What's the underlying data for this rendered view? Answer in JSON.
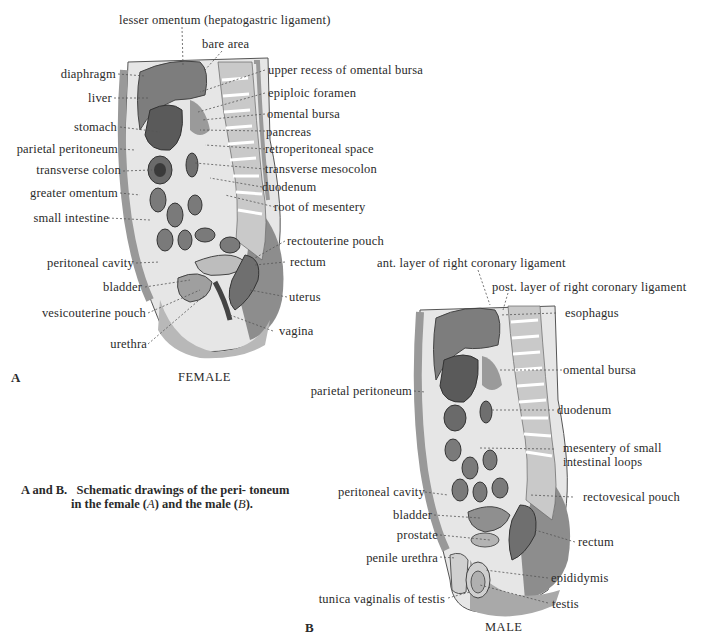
{
  "figure_a": {
    "letter": "A",
    "sex_label": "FEMALE",
    "labels": {
      "lesser_omentum": "lesser omentum (hepatogastric ligament)",
      "bare_area": "bare area",
      "diaphragm": "diaphragm",
      "liver": "liver",
      "stomach": "stomach",
      "parietal_peritoneum": "parietal peritoneum",
      "transverse_colon": "transverse colon",
      "greater_omentum": "greater omentum",
      "small_intestine": "small intestine",
      "peritoneal_cavity": "peritoneal cavity",
      "bladder": "bladder",
      "vesicouterine_pouch": "vesicouterine pouch",
      "urethra": "urethra",
      "upper_recess": "upper recess of omental bursa",
      "epiploic_foramen": "epiploic foramen",
      "omental_bursa": "omental bursa",
      "pancreas": "pancreas",
      "retroperitoneal_space": "retroperitoneal space",
      "transverse_mesocolon": "transverse mesocolon",
      "duodenum": "duodenum",
      "root_of_mesentery": "root of mesentery",
      "rectouterine_pouch": "rectouterine pouch",
      "rectum": "rectum",
      "uterus": "uterus",
      "vagina": "vagina"
    }
  },
  "figure_b": {
    "letter": "B",
    "sex_label": "MALE",
    "labels": {
      "ant_layer": "ant. layer of right coronary ligament",
      "post_layer": "post. layer of right coronary ligament",
      "esophagus": "esophagus",
      "omental_bursa": "omental bursa",
      "parietal_peritoneum": "parietal peritoneum",
      "duodenum": "duodenum",
      "mesentery_line1": "mesentery of small",
      "mesentery_line2": "intestinal loops",
      "peritoneal_cavity": "peritoneal cavity",
      "rectovesical_pouch": "rectovesical pouch",
      "bladder": "bladder",
      "prostate": "prostate",
      "penile_urethra": "penile urethra",
      "rectum": "rectum",
      "epididymis": "epididymis",
      "tunica_vaginalis": "tunica vaginalis of testis",
      "testis": "testis"
    }
  },
  "caption": {
    "lead": "A and B.",
    "text1": "Schematic drawings of the peri-",
    "text2": "toneum in the female (",
    "a_ref": "A",
    "text3": ") and the male",
    "text4": "(",
    "b_ref": "B",
    "text5": ")."
  }
}
